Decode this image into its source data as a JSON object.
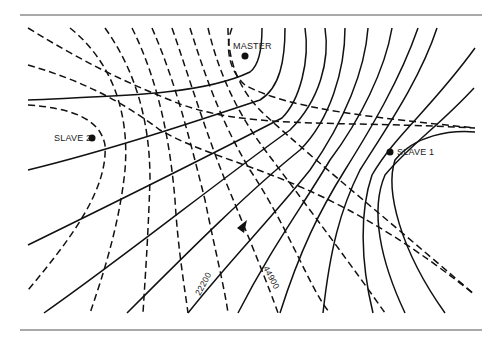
{
  "diagram": {
    "type": "hyperbolic navigation (LORAN) line-of-position chart",
    "stations": {
      "master": {
        "label": "MASTER",
        "x": 245,
        "y": 56
      },
      "slave1": {
        "label": "SLAVE 1",
        "x": 390,
        "y": 152
      },
      "slave2": {
        "label": "SLAVE 2",
        "x": 92,
        "y": 138
      }
    },
    "line_labels": {
      "solid_family_label": "22200",
      "dashed_family_label": "44900"
    },
    "indicator": {
      "name": "position-arrow",
      "direction": "up-right"
    },
    "colors": {
      "ink": "#111111",
      "rule": "#555555",
      "background": "#ffffff"
    }
  }
}
